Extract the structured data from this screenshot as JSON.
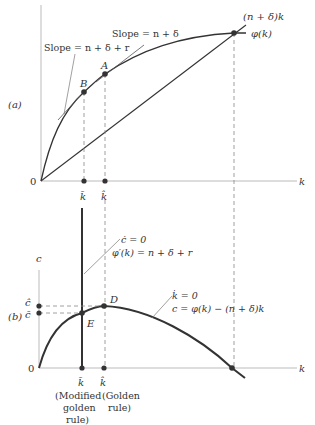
{
  "figure": {
    "panel_a": {
      "label": "(a)",
      "origin_label": "0",
      "x_axis_label": "k",
      "line_label": "(n + δ)k",
      "curve_label": "φ(k)",
      "slope_label_A": "Slope = n + δ",
      "slope_label_B": "Slope = n + δ + r",
      "point_A": "A",
      "point_B": "B",
      "tick_kbar": "k̄",
      "tick_khat": "k̂"
    },
    "panel_b": {
      "label": "(b)",
      "origin_label": "0",
      "x_axis_label": "k",
      "y_axis_label": "c",
      "cdot_label": "ċ = 0",
      "cdot_eq": "φ′(k) = n + δ + r",
      "kdot_label": "k̇ = 0",
      "kdot_eq": "c = φ(k) − (n + δ)k",
      "point_D": "D",
      "point_E": "E",
      "tick_chat": "ĉ",
      "tick_cbar": "c̄",
      "tick_kbar": "k̄",
      "tick_khat": "k̂",
      "caption_kbar": [
        "(Modified",
        "golden",
        "rule)"
      ],
      "caption_khat": [
        "(Golden",
        "rule)"
      ]
    }
  }
}
